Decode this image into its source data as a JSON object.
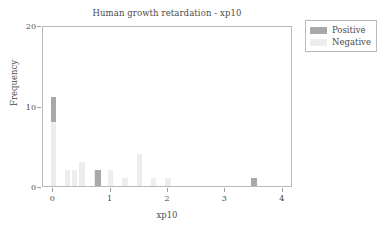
{
  "chart_data": {
    "type": "bar",
    "title": "Human growth retardation - xp10",
    "xlabel": "xp10",
    "ylabel": "Frequency",
    "xlim": [
      -0.18,
      4.18
    ],
    "ylim": [
      0,
      20
    ],
    "xticks": [
      0,
      1,
      2,
      3,
      4
    ],
    "xtick_labels": [
      "0",
      "1",
      "2",
      "3",
      "4"
    ],
    "yticks": [
      0,
      10,
      20
    ],
    "ytick_labels": [
      "0",
      "10",
      "20"
    ],
    "grid": false,
    "stacked": true,
    "legend_position": "upper right outside",
    "series": [
      {
        "name": "Positive",
        "color": "#a8a8a8",
        "values": [
          3,
          0,
          0,
          0,
          0,
          0,
          2,
          0,
          0,
          0,
          0,
          0,
          0,
          0,
          1
        ]
      },
      {
        "name": "Negative",
        "color": "#ededed",
        "values": [
          8,
          2,
          2,
          3,
          0,
          2,
          0,
          2,
          1,
          4,
          1,
          1,
          0,
          0,
          0
        ]
      }
    ],
    "x": [
      0.0,
      0.25,
      0.375,
      0.5,
      0.625,
      0.75,
      0.78,
      1.0,
      1.25,
      1.5,
      1.75,
      2.0,
      2.5,
      3.0,
      3.5
    ],
    "bar_width": 0.09,
    "totals": [
      11,
      2,
      2,
      3,
      0,
      2,
      2,
      2,
      1,
      4,
      1,
      1,
      0,
      0,
      1
    ]
  },
  "legend": {
    "items": [
      {
        "label": "Positive",
        "color": "#a8a8a8"
      },
      {
        "label": "Negative",
        "color": "#ededed"
      }
    ]
  },
  "colors": {
    "positive": "#a8a8a8",
    "negative": "#ededed",
    "frame": "#b9b9b9",
    "text": "#4a4a4a",
    "background": "#ffffff"
  }
}
